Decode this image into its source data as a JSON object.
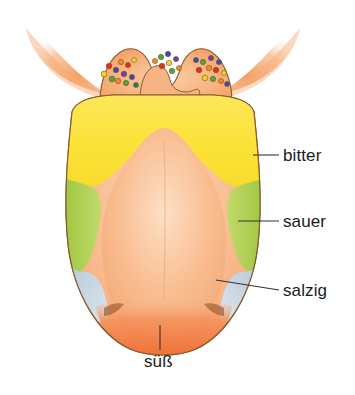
{
  "figure": {
    "name": "tongue-taste-zones-diagram",
    "title": "",
    "language": "de",
    "background_color": "#ffffff",
    "width": 355,
    "height": 395
  },
  "labels": [
    {
      "id": "bitter",
      "text": "bitter",
      "zone": "back of tongue",
      "zone_color": "#FBE234",
      "leader": {
        "x1": 253,
        "y1": 155,
        "x2": 279,
        "y2": 155
      },
      "text_x": 283,
      "text_y": 146
    },
    {
      "id": "sauer",
      "text": "sauer",
      "zone": "lateral sides",
      "zone_color": "#AFCF4E",
      "leader": {
        "x1": 238,
        "y1": 221,
        "x2": 279,
        "y2": 221
      },
      "text_x": 283,
      "text_y": 212
    },
    {
      "id": "salzig",
      "text": "salzig",
      "zone": "front sides",
      "zone_color": "#C3D2DE",
      "leader": {
        "x1": 216,
        "y1": 280,
        "x2": 279,
        "y2": 290
      },
      "text_x": 283,
      "text_y": 281
    },
    {
      "id": "suess",
      "text": "süß",
      "zone": "tip of tongue",
      "zone_color": "#F07A3D",
      "leader": {
        "x1": 160,
        "y1": 325,
        "x2": 160,
        "y2": 350
      },
      "text_x": 144,
      "text_y": 352
    }
  ],
  "colors": {
    "bitter_yellow": "#FBE234",
    "sauer_green": "#AFCF4E",
    "salzig_blue": "#C3D2DE",
    "suess_orange": "#F07A3D",
    "tongue_body_orange": "#F8B98A",
    "tongue_body_light": "#FBD1AD",
    "arch_orange": "#F7A869",
    "outline_brown": "#8A5A2B",
    "leader_line": "#333333",
    "label_text": "#1b1b1b"
  },
  "papillae": {
    "description": "circumvallate papillae shown as colored dots along the terminal sulcus",
    "dot_colors": [
      "#E03020",
      "#F08A20",
      "#F5D020",
      "#4FA83A",
      "#3A4FA8",
      "#7A3AA8",
      "#208060"
    ],
    "left_group": [
      {
        "x": 104,
        "y": 74,
        "c": "#F5D020",
        "r": 3.0
      },
      {
        "x": 109,
        "y": 66,
        "c": "#E03020",
        "r": 2.8
      },
      {
        "x": 112,
        "y": 79,
        "c": "#4FA83A",
        "r": 2.9
      },
      {
        "x": 116,
        "y": 70,
        "c": "#3A4FA8",
        "r": 2.7
      },
      {
        "x": 118,
        "y": 81,
        "c": "#F08A20",
        "r": 2.8
      },
      {
        "x": 121,
        "y": 62,
        "c": "#F08A20",
        "r": 2.7
      },
      {
        "x": 124,
        "y": 74,
        "c": "#7A3AA8",
        "r": 2.8
      },
      {
        "x": 126,
        "y": 83,
        "c": "#4FA83A",
        "r": 2.7
      },
      {
        "x": 128,
        "y": 65,
        "c": "#E03020",
        "r": 2.6
      },
      {
        "x": 132,
        "y": 77,
        "c": "#3A4FA8",
        "r": 2.6
      },
      {
        "x": 134,
        "y": 60,
        "c": "#F5D020",
        "r": 2.5
      },
      {
        "x": 136,
        "y": 85,
        "c": "#208060",
        "r": 2.5
      }
    ],
    "center_group": [
      {
        "x": 155,
        "y": 61,
        "c": "#F08A20",
        "r": 2.6
      },
      {
        "x": 161,
        "y": 57,
        "c": "#4FA83A",
        "r": 2.7
      },
      {
        "x": 162,
        "y": 66,
        "c": "#E03020",
        "r": 2.8
      },
      {
        "x": 168,
        "y": 54,
        "c": "#3A4FA8",
        "r": 2.7
      },
      {
        "x": 169,
        "y": 63,
        "c": "#F5D020",
        "r": 2.7
      },
      {
        "x": 172,
        "y": 71,
        "c": "#4FA83A",
        "r": 2.8
      },
      {
        "x": 176,
        "y": 59,
        "c": "#7A3AA8",
        "r": 2.6
      },
      {
        "x": 179,
        "y": 68,
        "c": "#F08A20",
        "r": 2.6
      }
    ],
    "right_group": [
      {
        "x": 196,
        "y": 60,
        "c": "#3A4FA8",
        "r": 2.6
      },
      {
        "x": 199,
        "y": 70,
        "c": "#E03020",
        "r": 2.8
      },
      {
        "x": 203,
        "y": 62,
        "c": "#4FA83A",
        "r": 2.7
      },
      {
        "x": 205,
        "y": 78,
        "c": "#F5D020",
        "r": 2.8
      },
      {
        "x": 209,
        "y": 68,
        "c": "#F08A20",
        "r": 2.8
      },
      {
        "x": 211,
        "y": 58,
        "c": "#7A3AA8",
        "r": 2.6
      },
      {
        "x": 213,
        "y": 79,
        "c": "#4FA83A",
        "r": 2.7
      },
      {
        "x": 216,
        "y": 70,
        "c": "#E03020",
        "r": 2.7
      },
      {
        "x": 219,
        "y": 62,
        "c": "#3A4FA8",
        "r": 2.6
      },
      {
        "x": 221,
        "y": 81,
        "c": "#F08A20",
        "r": 2.6
      },
      {
        "x": 224,
        "y": 73,
        "c": "#F5D020",
        "r": 2.5
      },
      {
        "x": 227,
        "y": 84,
        "c": "#3A4FA8",
        "r": 2.5
      }
    ]
  }
}
